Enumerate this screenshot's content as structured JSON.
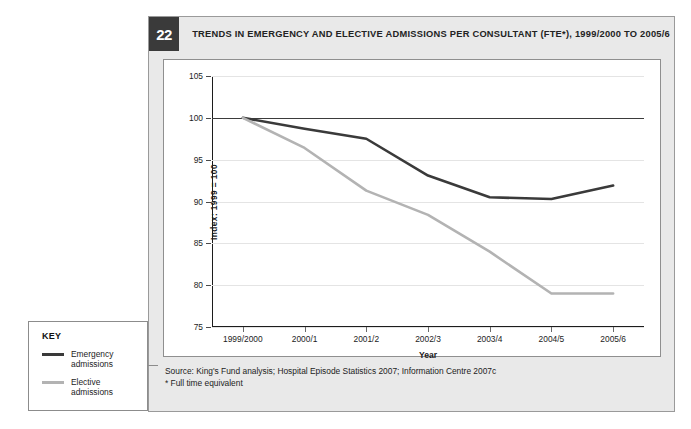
{
  "figure": {
    "number": "22",
    "title": "TRENDS IN EMERGENCY AND ELECTIVE ADMISSIONS PER CONSULTANT (FTE*), 1999/2000 TO 2005/6",
    "source_line": "Source: King's Fund analysis; Hospital Episode Statistics 2007; Information Centre 2007c",
    "footnote_line": "* Full time equivalent"
  },
  "key": {
    "title": "KEY",
    "items": [
      {
        "label": "Emergency\nadmissions",
        "label_line1": "Emergency",
        "label_line2": "admissions",
        "color": "#3a3a3a"
      },
      {
        "label": "Elective\nadmissions",
        "label_line1": "Elective",
        "label_line2": "admissions",
        "color": "#b3b3b3"
      }
    ]
  },
  "chart_data": {
    "type": "line",
    "title": "TRENDS IN EMERGENCY AND ELECTIVE ADMISSIONS PER CONSULTANT (FTE*), 1999/2000 TO 2005/6",
    "xlabel": "Year",
    "ylabel": "Index: 1999 = 100",
    "categories": [
      "1999/2000",
      "2000/1",
      "2001/2",
      "2002/3",
      "2003/4",
      "2004/5",
      "2005/6"
    ],
    "series": [
      {
        "name": "Emergency admissions",
        "color": "#3a3a3a",
        "values": [
          100,
          98.7,
          97.5,
          93.1,
          90.5,
          90.3,
          91.9
        ]
      },
      {
        "name": "Elective admissions",
        "color": "#b3b3b3",
        "values": [
          100,
          96.4,
          91.3,
          88.4,
          84.0,
          79.0,
          79.0
        ]
      }
    ],
    "ylim": [
      75,
      105
    ],
    "yticks": [
      105,
      100,
      95,
      90,
      85,
      80,
      75
    ],
    "ytick_labels": [
      "105",
      "100",
      "95",
      "90",
      "85",
      "80",
      "75"
    ],
    "grid": true,
    "reference_line": 100,
    "legend_position": "external-left"
  }
}
